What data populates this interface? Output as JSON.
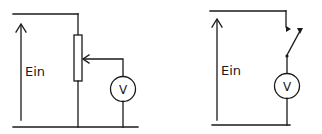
{
  "diagram": {
    "left_circuit": {
      "description": "Potentiometer voltage divider with voltmeter on wiper",
      "input_label": "Ein",
      "meter_label": "V",
      "components": [
        "input-voltage-arrow",
        "potentiometer",
        "wiper",
        "voltmeter"
      ]
    },
    "right_circuit": {
      "description": "Switch in series with voltmeter across input",
      "input_label": "Ein",
      "meter_label": "V",
      "components": [
        "input-voltage-arrow",
        "switch",
        "voltmeter"
      ]
    },
    "colors": {
      "line": "#1a1a1a",
      "background": "#ffffff"
    }
  }
}
